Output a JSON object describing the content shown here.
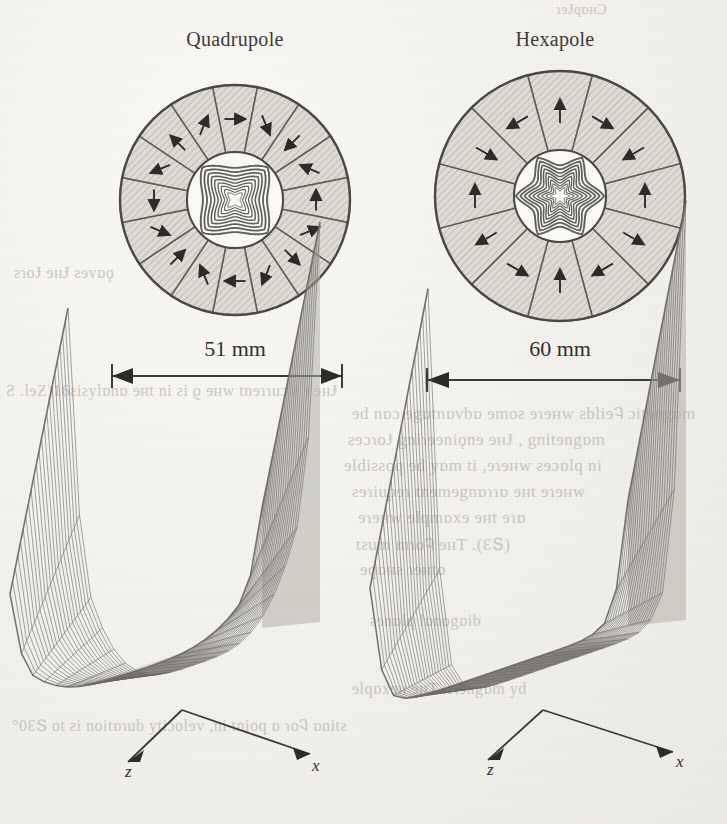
{
  "figure": {
    "kind": "scanned-journal-figure"
  },
  "panels": [
    {
      "id": "quadrupole",
      "title": "Quadrupole",
      "segments": 16,
      "star_points": 4,
      "dimension_label": "51 mm",
      "dimension_value": 51,
      "dimension_unit": "mm"
    },
    {
      "id": "hexapole",
      "title": "Hexapole",
      "segments": 12,
      "star_points": 6,
      "dimension_label": "60 mm",
      "dimension_value": 60,
      "dimension_unit": "mm"
    }
  ],
  "surface_plots": [
    {
      "id": "quadrupole-surface",
      "axis_x": "x",
      "axis_z": "z"
    },
    {
      "id": "hexapole-surface",
      "axis_x": "x",
      "axis_z": "z"
    }
  ],
  "chart_data": {
    "type": "line",
    "title": "",
    "xlabel": "x",
    "ylabel": "z",
    "series": [
      {
        "name": "Quadrupole |B| surface",
        "note": "3-D wireframe mesh; field magnitude rises steeply toward the pole tips leaving a narrow V-shaped valley through the bore centre",
        "valley_width": "narrow",
        "peak_sharpness": "sharp",
        "mesh_rows": 22,
        "mesh_cols": 22
      },
      {
        "name": "Hexapole |B| surface",
        "note": "3-D wireframe mesh; broader flat-bottomed valley between the two steep field walls",
        "valley_width": "broad",
        "peak_sharpness": "sharp",
        "mesh_rows": 22,
        "mesh_cols": 22
      }
    ],
    "legend": "none",
    "grid": false
  },
  "colors": {
    "paper": "#f3f2ee",
    "ink": "#3b3a36",
    "magnet_fill": "#dcdad3",
    "magnet_edge": "#5e5b54",
    "mesh": "#6f6c65",
    "ghost": "#b9b6ac"
  },
  "bleed_through_text": [
    "magnetic",
    "in supercon",
    "it may be possible",
    "requires",
    "example",
    "(2.3). The",
    "shape"
  ]
}
